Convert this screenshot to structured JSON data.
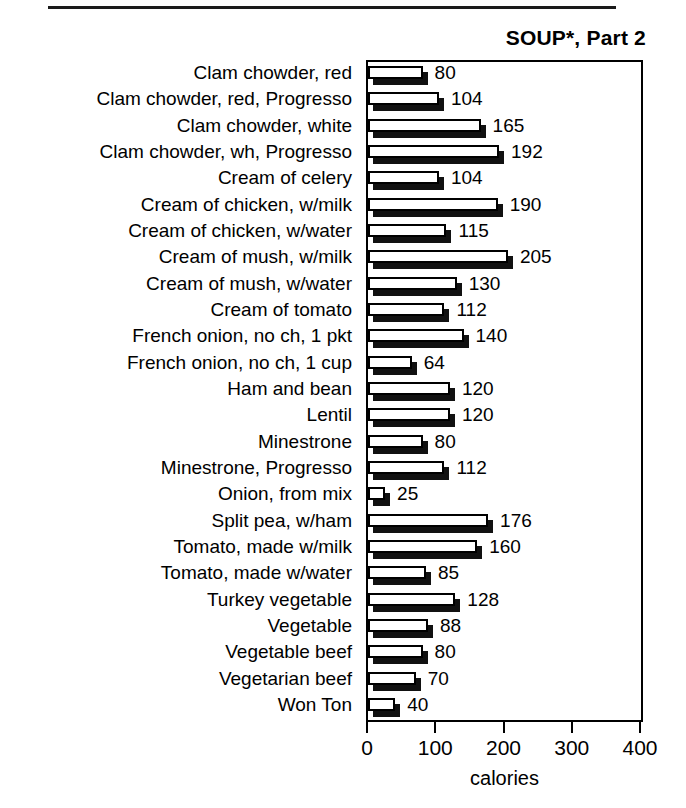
{
  "document": {
    "top_rule": "horizontal-rule"
  },
  "chart_data": {
    "type": "bar",
    "orientation": "horizontal",
    "title": "SOUP*, Part 2",
    "xlabel": "calories",
    "ylabel": "",
    "xlim": [
      0,
      400
    ],
    "xticks": [
      0,
      100,
      200,
      300,
      400
    ],
    "xtick_labels": [
      "0",
      "100",
      "200",
      "300",
      "400"
    ],
    "grid": false,
    "legend": null,
    "categories": [
      "Clam chowder, red",
      "Clam chowder, red, Progresso",
      "Clam chowder, white",
      "Clam chowder, wh, Progresso",
      "Cream of celery",
      "Cream of chicken, w/milk",
      "Cream of chicken, w/water",
      "Cream of mush, w/milk",
      "Cream of mush, w/water",
      "Cream of tomato",
      "French onion, no ch, 1 pkt",
      "French onion, no ch, 1 cup",
      "Ham and bean",
      "Lentil",
      "Minestrone",
      "Minestrone, Progresso",
      "Onion, from mix",
      "Split pea, w/ham",
      "Tomato, made w/milk",
      "Tomato, made w/water",
      "Turkey vegetable",
      "Vegetable",
      "Vegetable beef",
      "Vegetarian beef",
      "Won Ton"
    ],
    "values": [
      80,
      104,
      165,
      192,
      104,
      190,
      115,
      205,
      130,
      112,
      140,
      64,
      120,
      120,
      80,
      112,
      25,
      176,
      160,
      85,
      128,
      88,
      80,
      70,
      40
    ],
    "value_labels": [
      "80",
      "104",
      "165",
      "192",
      "104",
      "190",
      "115",
      "205",
      "130",
      "112",
      "140",
      "64",
      "120",
      "120",
      "80",
      "112",
      "25",
      "176",
      "160",
      "85",
      "128",
      "88",
      "80",
      "70",
      "40"
    ],
    "bar_style": {
      "face_color": "#ffffff",
      "edge_color": "#000000",
      "shadow_color": "#111111",
      "three_d": true
    }
  }
}
